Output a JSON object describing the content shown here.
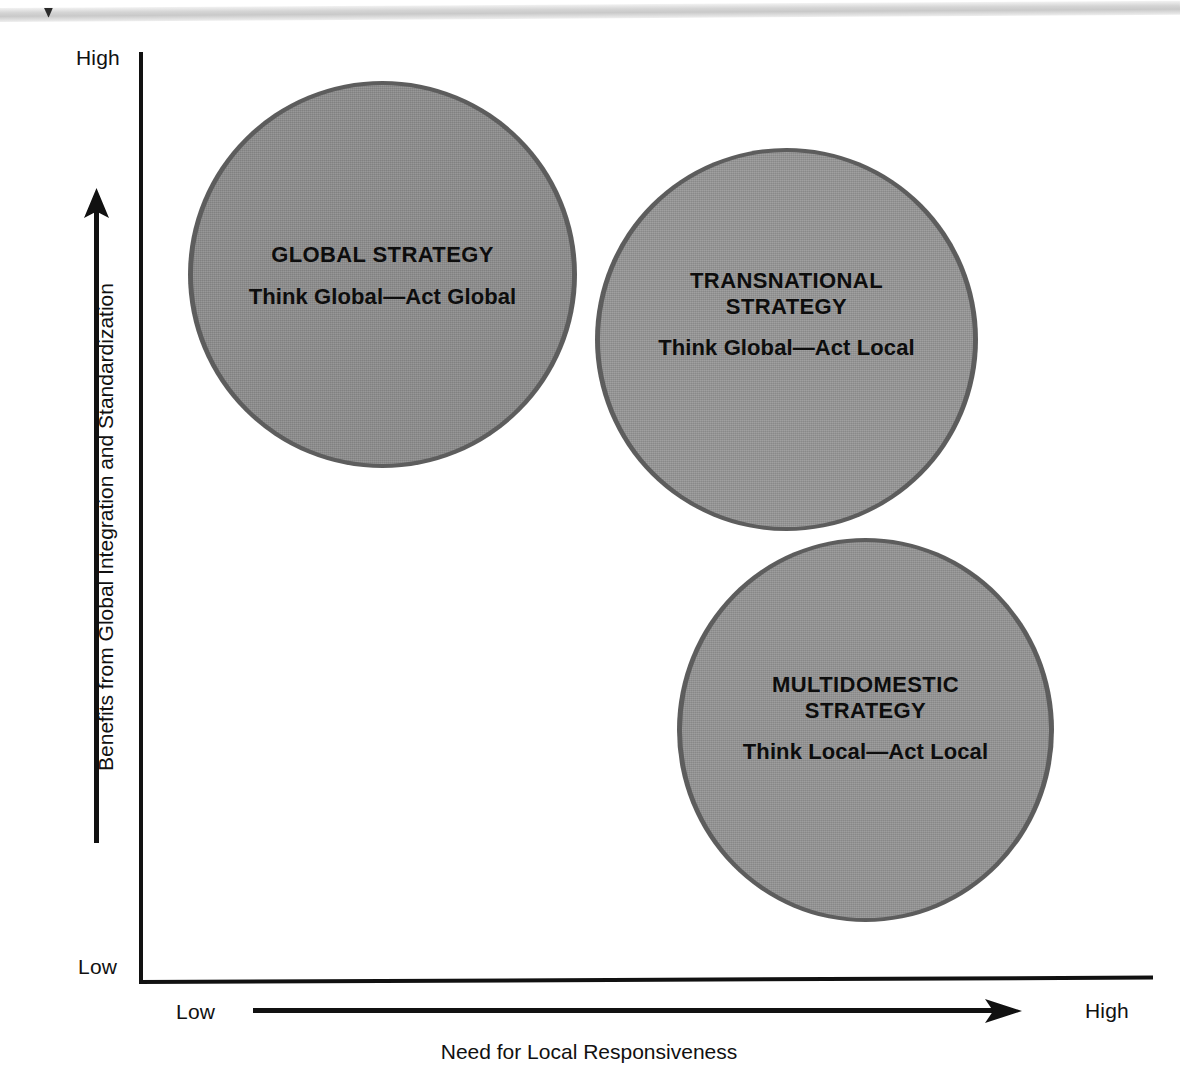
{
  "figure": {
    "background_color": "#ffffff"
  },
  "axes": {
    "y": {
      "title": "Benefits from Global Integration and Standardization",
      "high_label": "High",
      "low_label": "Low"
    },
    "x": {
      "title": "Need for Local Responsiveness",
      "low_label": "Low",
      "high_label": "High"
    }
  },
  "chart_data": {
    "type": "scatter",
    "title": "",
    "xlabel": "Need for Local Responsiveness",
    "ylabel": "Benefits from Global Integration and Standardization",
    "xlim": [
      "Low",
      "High"
    ],
    "ylim": [
      "Low",
      "High"
    ],
    "grid": false,
    "legend": "none",
    "bubbles": [
      {
        "id": "global",
        "title": "GLOBAL STRATEGY",
        "subtitle": "Think Global—Act Global",
        "x_position": "low",
        "y_position": "high",
        "color": "#8e8e8e",
        "ring_color": "#5d5d5d"
      },
      {
        "id": "transnational",
        "title_line1": "TRANSNATIONAL",
        "title_line2": "STRATEGY",
        "subtitle": "Think Global—Act Local",
        "x_position": "medium-high",
        "y_position": "high",
        "color": "#979797",
        "ring_color": "#5d5d5d"
      },
      {
        "id": "multidomestic",
        "title_line1": "MULTIDOMESTIC",
        "title_line2": "STRATEGY",
        "subtitle": "Think Local—Act Local",
        "x_position": "high",
        "y_position": "low-medium",
        "color": "#959595",
        "ring_color": "#5d5d5d"
      }
    ]
  }
}
